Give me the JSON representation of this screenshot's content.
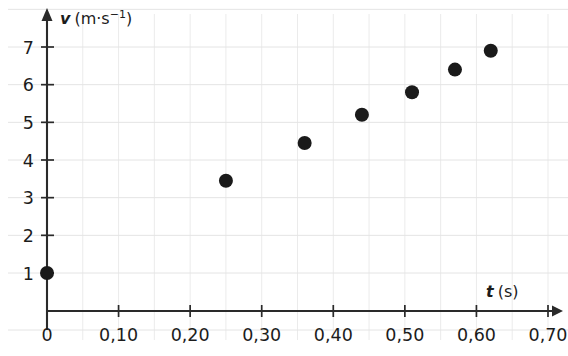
{
  "chart_data": {
    "type": "scatter",
    "title": "",
    "xlabel": "t (s)",
    "ylabel": "v (m·s⁻¹)",
    "x_symbol": "t",
    "x_unit": "(s)",
    "y_symbol": "v",
    "y_unit_prefix": "(m·s",
    "y_unit_exponent": "−1",
    "y_unit_suffix": ")",
    "xlim": [
      0,
      0.7
    ],
    "ylim": [
      0,
      7.6
    ],
    "grid": true,
    "grid_x_step": 0.05,
    "grid_y_step": 1,
    "legend": "none",
    "x_tick_labels": [
      "0",
      "0,10",
      "0,20",
      "0,30",
      "0,40",
      "0,50",
      "0,60",
      "0,70"
    ],
    "x_tick_values": [
      0,
      0.1,
      0.2,
      0.3,
      0.4,
      0.5,
      0.6,
      0.7
    ],
    "y_tick_labels": [
      "1",
      "2",
      "3",
      "4",
      "5",
      "6",
      "7"
    ],
    "y_tick_values": [
      1,
      2,
      3,
      4,
      5,
      6,
      7
    ],
    "x": [
      0.0,
      0.25,
      0.36,
      0.44,
      0.51,
      0.57,
      0.62
    ],
    "y": [
      1.0,
      3.45,
      4.45,
      5.2,
      5.8,
      6.4,
      6.9
    ],
    "points": [
      {
        "t": 0.0,
        "v": 1.0
      },
      {
        "t": 0.25,
        "v": 3.45
      },
      {
        "t": 0.36,
        "v": 4.45
      },
      {
        "t": 0.44,
        "v": 5.2
      },
      {
        "t": 0.51,
        "v": 5.8
      },
      {
        "t": 0.57,
        "v": 6.4
      },
      {
        "t": 0.62,
        "v": 6.9
      }
    ],
    "marker": "filled-circle",
    "marker_color": "#1a1a1a",
    "marker_radius_px": 7,
    "grid_color": "#e8e8e8",
    "axis_color": "#2a2a2a",
    "background_color": "#ffffff"
  }
}
